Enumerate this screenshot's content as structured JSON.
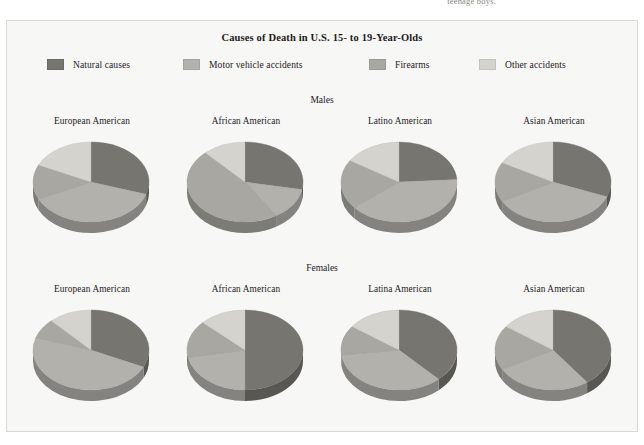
{
  "page_fragment": "teenage boys.",
  "figure": {
    "title": "Causes of Death in U.S. 15- to 19-Year-Olds",
    "sections": [
      {
        "label": "Males"
      },
      {
        "label": "Females"
      }
    ]
  },
  "legend": {
    "items": [
      {
        "label": "Natural causes",
        "color": "#77756f"
      },
      {
        "label": "Motor vehicle accidents",
        "color": "#b2b1ab"
      },
      {
        "label": "Firearms",
        "color": "#a8a7a1"
      },
      {
        "label": "Other accidents",
        "color": "#d4d3cd"
      }
    ]
  },
  "chart_data": {
    "type": "pie",
    "title": "Causes of Death in U.S. 15- to 19-Year-Olds",
    "legend_position": "top",
    "categories": [
      "Natural causes",
      "Motor vehicle accidents",
      "Firearms",
      "Other accidents"
    ],
    "colors": [
      "#77756f",
      "#b2b1ab",
      "#a8a7a1",
      "#d4d3cd"
    ],
    "units": "percent",
    "charts": [
      {
        "group": "Males",
        "label": "European American",
        "values": [
          30,
          38,
          14,
          18
        ]
      },
      {
        "group": "Males",
        "label": "African American",
        "values": [
          28,
          13,
          47,
          12
        ]
      },
      {
        "group": "Males",
        "label": "Latino American",
        "values": [
          24,
          40,
          20,
          16
        ]
      },
      {
        "group": "Males",
        "label": "Asian American",
        "values": [
          31,
          36,
          16,
          17
        ]
      },
      {
        "group": "Females",
        "label": "European American",
        "values": [
          32,
          48,
          8,
          12
        ]
      },
      {
        "group": "Females",
        "label": "African American",
        "values": [
          50,
          22,
          15,
          13
        ]
      },
      {
        "group": "Females",
        "label": "Latina American",
        "values": [
          38,
          35,
          12,
          15
        ]
      },
      {
        "group": "Females",
        "label": "Asian American",
        "values": [
          40,
          27,
          18,
          15
        ]
      }
    ]
  }
}
